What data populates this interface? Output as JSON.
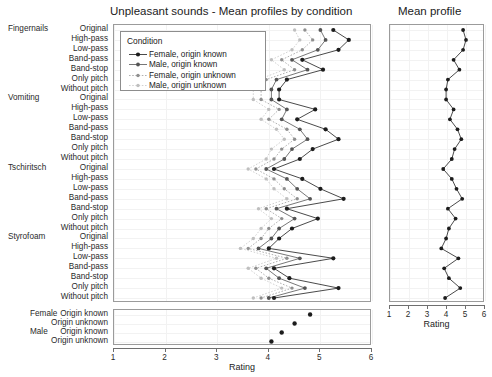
{
  "titles": {
    "main": "Unpleasant sounds - Mean profiles by condition",
    "right": "Mean profile"
  },
  "legend": {
    "title": "Condition",
    "items": [
      {
        "label": "Female, origin known",
        "color": "#1c1c1c"
      },
      {
        "label": "Male, origin known",
        "color": "#545454"
      },
      {
        "label": "Female, origin unknown",
        "color": "#8f8f8f"
      },
      {
        "label": "Male, origin unknown",
        "color": "#bfbfbf"
      }
    ]
  },
  "axis": {
    "xlabel": "Rating",
    "ticks": [
      "1",
      "2",
      "3",
      "4",
      "5",
      "6"
    ],
    "xlim": [
      1,
      6
    ]
  },
  "groups": [
    "Fingernails",
    "Vomiting",
    "Tschiritsch",
    "Styrofoam"
  ],
  "conditions": [
    "Original",
    "High-pass",
    "Low-pass",
    "Band-pass",
    "Band-stop",
    "Only pitch",
    "Without pitch"
  ],
  "bottom": {
    "groups": [
      "Female",
      "Male"
    ],
    "rows": [
      "Origin known",
      "Origin unknown",
      "Origin known",
      "Origin unknown"
    ]
  },
  "chart_data": {
    "type": "line",
    "title": "Unpleasant sounds - Mean profiles by condition",
    "xlabel": "Rating",
    "ylabel": "",
    "xlim": [
      1,
      6
    ],
    "grid": true,
    "legend_position": "top-left inside",
    "orientation": "horizontal-dotplot",
    "categories": [
      "Fingernails: Original",
      "Fingernails: High-pass",
      "Fingernails: Low-pass",
      "Fingernails: Band-pass",
      "Fingernails: Band-stop",
      "Fingernails: Only pitch",
      "Fingernails: Without pitch",
      "Vomiting: Original",
      "Vomiting: High-pass",
      "Vomiting: Low-pass",
      "Vomiting: Band-pass",
      "Vomiting: Band-stop",
      "Vomiting: Only pitch",
      "Vomiting: Without pitch",
      "Tschiritsch: Original",
      "Tschiritsch: High-pass",
      "Tschiritsch: Low-pass",
      "Tschiritsch: Band-pass",
      "Tschiritsch: Band-stop",
      "Tschiritsch: Only pitch",
      "Tschiritsch: Without pitch",
      "Styrofoam: Original",
      "Styrofoam: High-pass",
      "Styrofoam: Low-pass",
      "Styrofoam: Band-pass",
      "Styrofoam: Band-stop",
      "Styrofoam: Only pitch",
      "Styrofoam: Without pitch"
    ],
    "series": [
      {
        "name": "Female, origin known",
        "color": "#1c1c1c",
        "values": [
          5.25,
          5.55,
          5.35,
          4.65,
          5.05,
          4.35,
          4.2,
          4.2,
          4.9,
          4.55,
          5.1,
          5.35,
          4.85,
          4.6,
          4.1,
          4.65,
          5.0,
          5.45,
          4.35,
          4.95,
          4.45,
          4.2,
          4.0,
          5.25,
          4.1,
          4.4,
          5.35,
          4.1
        ]
      },
      {
        "name": "Male, origin known",
        "color": "#545454",
        "values": [
          5.0,
          5.1,
          4.95,
          4.45,
          4.75,
          4.15,
          4.05,
          4.05,
          4.35,
          4.25,
          4.6,
          4.75,
          4.45,
          4.3,
          3.95,
          4.35,
          4.55,
          4.8,
          4.15,
          4.5,
          4.2,
          4.05,
          3.8,
          4.6,
          3.95,
          4.2,
          4.7,
          4.0
        ]
      },
      {
        "name": "Female, origin unknown",
        "color": "#8f8f8f",
        "values": [
          4.7,
          4.85,
          4.65,
          4.25,
          4.5,
          3.95,
          3.85,
          3.85,
          4.2,
          4.0,
          4.35,
          4.5,
          4.25,
          4.1,
          3.75,
          4.1,
          4.3,
          4.55,
          3.95,
          4.25,
          4.0,
          3.85,
          3.6,
          4.35,
          3.75,
          4.0,
          4.45,
          3.85
        ]
      },
      {
        "name": "Male, origin unknown",
        "color": "#bfbfbf",
        "values": [
          4.5,
          4.6,
          4.45,
          4.05,
          4.3,
          3.8,
          3.7,
          3.7,
          4.0,
          3.85,
          4.15,
          4.3,
          4.05,
          3.95,
          3.6,
          3.95,
          4.1,
          4.35,
          3.8,
          4.05,
          3.85,
          3.7,
          3.45,
          4.15,
          3.6,
          3.85,
          4.25,
          3.7
        ]
      }
    ],
    "mean_profile": {
      "name": "Mean profile",
      "color": "#1c1c1c",
      "values": [
        4.85,
        5.0,
        4.85,
        4.35,
        4.65,
        4.05,
        3.95,
        3.95,
        4.35,
        4.15,
        4.55,
        4.75,
        4.4,
        4.25,
        3.8,
        4.25,
        4.5,
        4.8,
        4.05,
        4.45,
        4.1,
        3.95,
        3.7,
        4.6,
        3.85,
        4.1,
        4.7,
        3.9
      ]
    },
    "marginal_means": {
      "title": "Marginal means",
      "categories": [
        "Female, Origin known",
        "Female, Origin unknown",
        "Male, Origin known",
        "Male, Origin unknown"
      ],
      "values": [
        4.8,
        4.5,
        4.25,
        4.05
      ],
      "color": "#1c1c1c"
    }
  }
}
